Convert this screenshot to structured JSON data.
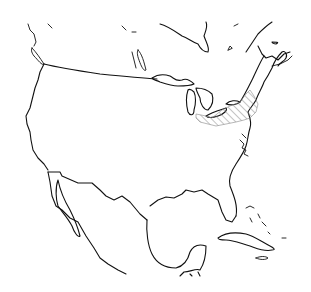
{
  "map": {
    "type": "outline-map",
    "region": "North America",
    "style": "black line drawing on white background",
    "colors": {
      "background": "#ffffff",
      "outline": "#111111",
      "hatch": "#888888"
    },
    "features": [
      {
        "name": "United States",
        "kind": "country-outline"
      },
      {
        "name": "Mexico",
        "kind": "country-outline"
      },
      {
        "name": "Canada (southern portion)",
        "kind": "partial-outline"
      },
      {
        "name": "Great Lakes",
        "kind": "water-bodies"
      },
      {
        "name": "Hudson Bay (southern tip)",
        "kind": "water-body"
      },
      {
        "name": "Gulf of Mexico",
        "kind": "water-body"
      },
      {
        "name": "Baja California",
        "kind": "peninsula"
      },
      {
        "name": "Florida",
        "kind": "peninsula"
      },
      {
        "name": "Cuba",
        "kind": "island"
      },
      {
        "name": "Bahamas",
        "kind": "islands"
      },
      {
        "name": "Vancouver Island",
        "kind": "island"
      }
    ],
    "highlighted_region": {
      "pattern": "diagonal hatching",
      "approx_location": "southern Ontario / New York / Pennsylvania / New England area (east of the Great Lakes)"
    },
    "labels": []
  }
}
